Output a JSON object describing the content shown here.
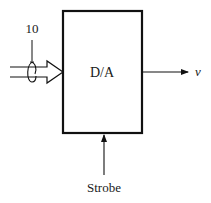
{
  "diagram": {
    "block": {
      "label": "D/A"
    },
    "input_bus": {
      "width_label": "10"
    },
    "output": {
      "label": "v"
    },
    "control": {
      "label": "Strobe"
    },
    "colors": {
      "stroke": "#111111",
      "background": "#ffffff"
    }
  }
}
